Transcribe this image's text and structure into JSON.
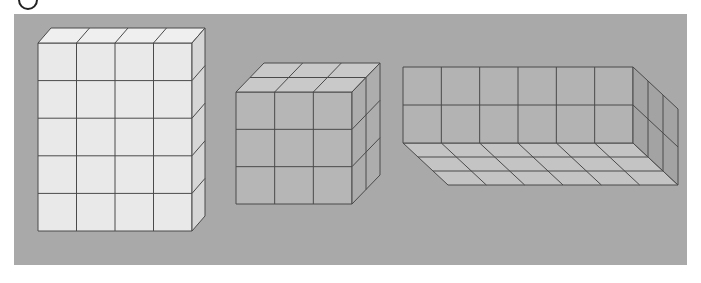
{
  "figure": {
    "type": "3d-unit-cube-solids",
    "label_marker": "circled-number (cropped)",
    "panel": {
      "x": 14,
      "y": 14,
      "width": 673,
      "height": 251,
      "color": "#a9a9a9"
    },
    "colors": {
      "edge": "#4a4a4a",
      "solid1_front": "#e9e9e9",
      "solid1_top": "#efefef",
      "solid1_side": "#d6d6d6",
      "solid2_front": "#b6b6b6",
      "solid2_top": "#c9c9c9",
      "solid2_side": "#adadad",
      "solid3_back": "#b3b3b3",
      "solid3_side": "#a3a3a3",
      "solid3_floor": "#c4c4c4"
    },
    "solids": [
      {
        "name": "tall-rectangular-prism",
        "description": "Closed rectangular prism of unit cubes",
        "columns": 4,
        "rows": 5,
        "depth": 1,
        "front": {
          "x0": 38,
          "y0": 43,
          "x1": 192,
          "y1": 231
        },
        "depth_offset": {
          "dx": 13,
          "dy": -15
        }
      },
      {
        "name": "cube-3x3x2",
        "description": "Closed block of unit cubes",
        "columns": 3,
        "rows": 3,
        "depth": 2,
        "front": {
          "x0": 236,
          "y0": 92,
          "x1": 352,
          "y1": 204
        },
        "depth_offset": {
          "dx": 28,
          "dy": -29
        }
      },
      {
        "name": "open-box-tray",
        "description": "Open box showing back wall, right wall and floor",
        "columns": 6,
        "rows": 2,
        "depth": 3,
        "back_wall": {
          "x0": 403,
          "y0": 67,
          "x1": 633,
          "y1": 143
        },
        "depth_offset": {
          "dx": 45,
          "dy": 42
        }
      }
    ]
  }
}
